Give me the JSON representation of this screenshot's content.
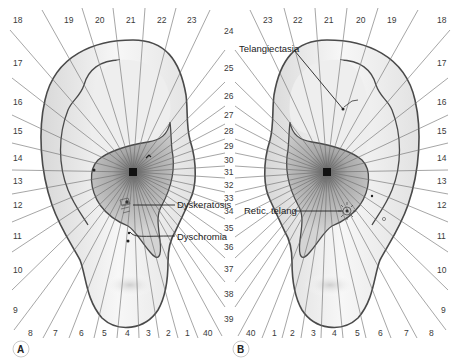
{
  "figure": {
    "panels": [
      {
        "id": "A",
        "label": "A",
        "side": "left-ear",
        "annotations": [
          {
            "text": "Dyskeratosis"
          },
          {
            "text": "Dyschromia"
          }
        ]
      },
      {
        "id": "B",
        "label": "B",
        "side": "right-ear",
        "annotations": [
          {
            "text": "Telangiectasia"
          },
          {
            "text": "Retic. telang"
          }
        ]
      }
    ],
    "zone_numbers": {
      "A_top": [
        "18",
        "19",
        "20",
        "21",
        "22",
        "23"
      ],
      "A_left": [
        "17",
        "16",
        "15",
        "14",
        "13",
        "12",
        "11",
        "10",
        "9"
      ],
      "A_bottom": [
        "8",
        "7",
        "6",
        "5",
        "4",
        "3",
        "2",
        "1",
        "40"
      ],
      "center": [
        "24",
        "25",
        "26",
        "27",
        "28",
        "29",
        "30",
        "31",
        "32",
        "33",
        "34",
        "35",
        "36",
        "37",
        "38",
        "39"
      ],
      "B_top": [
        "23",
        "22",
        "21",
        "20",
        "19",
        "18"
      ],
      "B_right": [
        "17",
        "16",
        "15",
        "14",
        "13",
        "12",
        "11",
        "10",
        "9"
      ],
      "B_bottom": [
        "40",
        "1",
        "2",
        "3",
        "4",
        "5",
        "6",
        "7",
        "8"
      ]
    },
    "colors": {
      "line": "#555555",
      "ear_outline": "#4a4a4a",
      "concha_shade": "#bdbdbd",
      "helix_fill": "#f0f0f0",
      "text": "#3a3a3a"
    }
  }
}
